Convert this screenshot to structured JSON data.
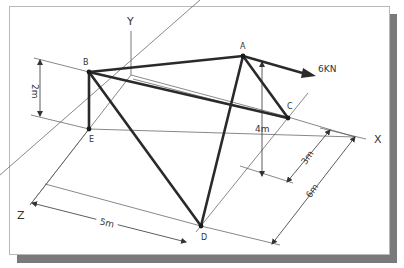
{
  "diagram": {
    "type": "3d-truss-isometric",
    "axes": {
      "x_label": "X",
      "y_label": "Y",
      "z_label": "Z"
    },
    "nodes": [
      {
        "id": "A",
        "label": "A"
      },
      {
        "id": "B",
        "label": "B"
      },
      {
        "id": "C",
        "label": "C"
      },
      {
        "id": "D",
        "label": "D"
      },
      {
        "id": "E",
        "label": "E"
      }
    ],
    "members": [
      {
        "from": "B",
        "to": "A"
      },
      {
        "from": "B",
        "to": "C"
      },
      {
        "from": "B",
        "to": "E"
      },
      {
        "from": "B",
        "to": "D"
      },
      {
        "from": "A",
        "to": "C"
      },
      {
        "from": "A",
        "to": "D"
      }
    ],
    "load": {
      "node": "A",
      "label": "6KN"
    },
    "dimensions": {
      "be_height": "2m",
      "a_height": "4m",
      "c_offset": "3m",
      "d_offset_x": "6m",
      "d_offset_z": "5m"
    }
  },
  "colors": {
    "member": "#2a2a2a",
    "construction": "#555555",
    "frame_shadow": "#7a7a7a",
    "background": "#ffffff"
  }
}
